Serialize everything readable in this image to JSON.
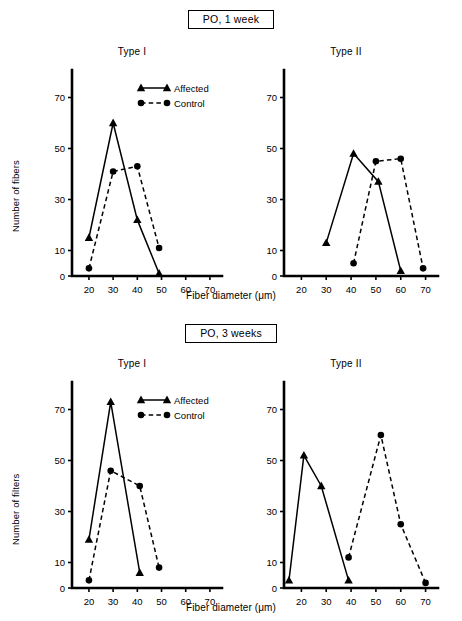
{
  "figure": {
    "axis_color": "#000000",
    "background": "#ffffff"
  },
  "panels": [
    {
      "id": "po-1-week",
      "title": "PO, 1 week",
      "ylabel": "Number of fibers",
      "xlabel": "Fiber diameter (μm)",
      "subplots": [
        {
          "id": "type-1",
          "title": "Type I"
        },
        {
          "id": "type-2",
          "title": "Type II"
        }
      ]
    },
    {
      "id": "po-3-weeks",
      "title": "PO, 3 weeks",
      "ylabel": "Number of filters",
      "xlabel": "Fiber diameter (μm)",
      "subplots": [
        {
          "id": "type-1",
          "title": "Type I"
        },
        {
          "id": "type-2",
          "title": "Type II"
        }
      ]
    }
  ],
  "legend": {
    "entries": [
      {
        "label": "Affected",
        "marker": "triangle",
        "line": "solid"
      },
      {
        "label": "Control",
        "marker": "circle",
        "line": "dashed"
      }
    ]
  },
  "chart_data": [
    {
      "id": "po-1-week-type-1",
      "type": "line",
      "title": "Type I",
      "panel": "PO, 1 week",
      "xlabel": "Fiber diameter (μm)",
      "ylabel": "Number of fibers",
      "xlim": [
        13,
        75
      ],
      "ylim": [
        0,
        80
      ],
      "xticks": [
        20,
        30,
        40,
        50,
        60,
        70
      ],
      "yticks": [
        0,
        10,
        30,
        50,
        70
      ],
      "grid": false,
      "legend_position": "top-right",
      "series": [
        {
          "name": "Affected",
          "marker": "triangle",
          "line": "solid",
          "x": [
            20,
            30,
            40,
            49
          ],
          "values": [
            15,
            60,
            22,
            1
          ]
        },
        {
          "name": "Control",
          "marker": "circle",
          "line": "dashed",
          "x": [
            20,
            30,
            40,
            49
          ],
          "values": [
            3,
            41,
            43,
            11
          ]
        }
      ]
    },
    {
      "id": "po-1-week-type-2",
      "type": "line",
      "title": "Type II",
      "panel": "PO, 1 week",
      "xlabel": "Fiber diameter (μm)",
      "ylabel": "Number of fibers",
      "xlim": [
        13,
        75
      ],
      "ylim": [
        0,
        80
      ],
      "xticks": [
        20,
        30,
        40,
        50,
        60,
        70
      ],
      "yticks": [
        0,
        10,
        30,
        50,
        70
      ],
      "grid": false,
      "legend_position": "none",
      "series": [
        {
          "name": "Affected",
          "marker": "triangle",
          "line": "solid",
          "x": [
            30,
            41,
            51,
            60
          ],
          "values": [
            13,
            48,
            37,
            2
          ]
        },
        {
          "name": "Control",
          "marker": "circle",
          "line": "dashed",
          "x": [
            41,
            50,
            60,
            69
          ],
          "values": [
            5,
            45,
            46,
            3
          ]
        }
      ]
    },
    {
      "id": "po-3-weeks-type-1",
      "type": "line",
      "title": "Type I",
      "panel": "PO, 3 weeks",
      "xlabel": "Fiber diameter (μm)",
      "ylabel": "Number of filters",
      "xlim": [
        13,
        75
      ],
      "ylim": [
        0,
        80
      ],
      "xticks": [
        20,
        30,
        40,
        50,
        60,
        70
      ],
      "yticks": [
        0,
        10,
        30,
        50,
        70
      ],
      "grid": false,
      "legend_position": "top-right",
      "series": [
        {
          "name": "Affected",
          "marker": "triangle",
          "line": "solid",
          "x": [
            20,
            29,
            41
          ],
          "values": [
            19,
            73,
            6
          ]
        },
        {
          "name": "Control",
          "marker": "circle",
          "line": "dashed",
          "x": [
            20,
            29,
            41,
            49
          ],
          "values": [
            3,
            46,
            40,
            8
          ]
        }
      ]
    },
    {
      "id": "po-3-weeks-type-2",
      "type": "line",
      "title": "Type II",
      "panel": "PO, 3 weeks",
      "xlabel": "Fiber diameter (μm)",
      "ylabel": "Number of filters",
      "xlim": [
        13,
        75
      ],
      "ylim": [
        0,
        80
      ],
      "xticks": [
        20,
        30,
        40,
        50,
        60,
        70
      ],
      "yticks": [
        0,
        10,
        30,
        50,
        70
      ],
      "grid": false,
      "legend_position": "none",
      "series": [
        {
          "name": "Affected",
          "marker": "triangle",
          "line": "solid",
          "x": [
            15,
            21,
            28,
            39
          ],
          "values": [
            3,
            52,
            40,
            3
          ]
        },
        {
          "name": "Control",
          "marker": "circle",
          "line": "dashed",
          "x": [
            39,
            52,
            60,
            70
          ],
          "values": [
            12,
            60,
            25,
            2
          ]
        }
      ]
    }
  ]
}
